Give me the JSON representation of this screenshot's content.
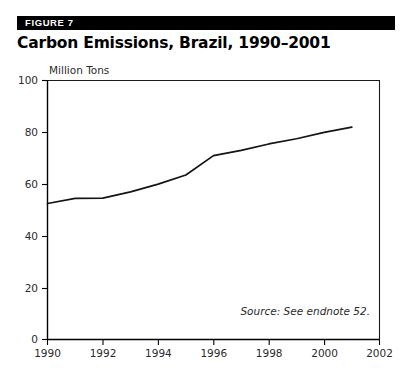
{
  "figure": {
    "badge_label": "FIGURE 7",
    "title": "Carbon Emissions, Brazil, 1990–2001"
  },
  "source": {
    "note": "Source: See endnote 52."
  },
  "colors": {
    "badge_background": "#000000",
    "badge_text": "#ffffff",
    "title_text": "#000000",
    "line": "#141414",
    "axis": "#000000",
    "tick_text": "#2b2b2b",
    "plot_background": "#ffffff"
  },
  "chart_data": {
    "type": "line",
    "title": "Carbon Emissions, Brazil, 1990–2001",
    "subtitle": "",
    "xlabel": "",
    "ylabel": "Million Tons",
    "unit_label": "Million Tons",
    "x": [
      1990,
      1991,
      1992,
      1993,
      1994,
      1995,
      1996,
      1997,
      1998,
      1999,
      2000,
      2001
    ],
    "values": [
      52.5,
      54.5,
      54.6,
      57.0,
      60.0,
      63.5,
      71.0,
      73.0,
      75.5,
      77.5,
      80.0,
      82.0
    ],
    "series": [
      {
        "name": "Carbon Emissions",
        "values": [
          52.5,
          54.5,
          54.6,
          57.0,
          60.0,
          63.5,
          71.0,
          73.0,
          75.5,
          77.5,
          80.0,
          82.0
        ]
      }
    ],
    "xlim": [
      1990,
      2002
    ],
    "ylim": [
      0,
      100
    ],
    "xticks": [
      1990,
      1992,
      1994,
      1996,
      1998,
      2000,
      2002
    ],
    "xtick_labels": [
      "1990",
      "1992",
      "1994",
      "1996",
      "1998",
      "2000",
      "2002"
    ],
    "yticks": [
      0,
      20,
      40,
      60,
      80,
      100
    ],
    "ytick_labels": [
      "0",
      "20",
      "40",
      "60",
      "80",
      "100"
    ],
    "grid": false,
    "legend": false,
    "legend_position": "none",
    "annotations": [
      "Source: See endnote 52."
    ]
  }
}
